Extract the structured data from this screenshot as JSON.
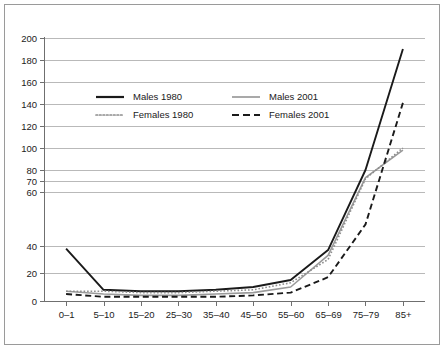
{
  "chart_data": {
    "type": "line",
    "title": "",
    "subtitle": "",
    "xlabel": "",
    "ylabel": "",
    "grid": true,
    "legend_position": "upper-left-inside",
    "categories": [
      "0–1",
      "5–10",
      "15–20",
      "25–30",
      "35–40",
      "45–50",
      "55–60",
      "65–69",
      "75–79",
      "85+"
    ],
    "ytick_labels": [
      "0",
      "20",
      "40",
      "60",
      "70",
      "80",
      "100",
      "120",
      "140",
      "160",
      "180",
      "200"
    ],
    "ytick_values": [
      0,
      20,
      40,
      60,
      70,
      80,
      100,
      120,
      140,
      160,
      180,
      200
    ],
    "ylim": [
      0,
      200
    ],
    "series": [
      {
        "name": "Males 1980",
        "color": "#1a1a1a",
        "style": "solid",
        "values": [
          38,
          8,
          7,
          7,
          8,
          10,
          15,
          37,
          80,
          190
        ]
      },
      {
        "name": "Males 2001",
        "color": "#9a9a9a",
        "style": "solid",
        "values": [
          7,
          5,
          4,
          4,
          5,
          6,
          10,
          33,
          73,
          98
        ]
      },
      {
        "name": "Females 1980",
        "color": "#8d8d8d",
        "style": "dotted",
        "values": [
          7,
          7,
          6,
          6,
          7,
          8,
          13,
          30,
          72,
          100
        ]
      },
      {
        "name": "Females 2001",
        "color": "#1a1a1a",
        "style": "dashed",
        "values": [
          5,
          3,
          3,
          3,
          3,
          4,
          6,
          17,
          48,
          141
        ]
      }
    ]
  },
  "legend": {
    "entries": [
      {
        "label": "Males 1980"
      },
      {
        "label": "Males 2001"
      },
      {
        "label": "Females 1980"
      },
      {
        "label": "Females 2001"
      }
    ]
  },
  "colors": {
    "dark_series": "#1a1a1a",
    "light_series": "#9a9a9a",
    "gridline": "#b9b9b9",
    "frame": "#9a9a9a",
    "background": "#ffffff"
  }
}
